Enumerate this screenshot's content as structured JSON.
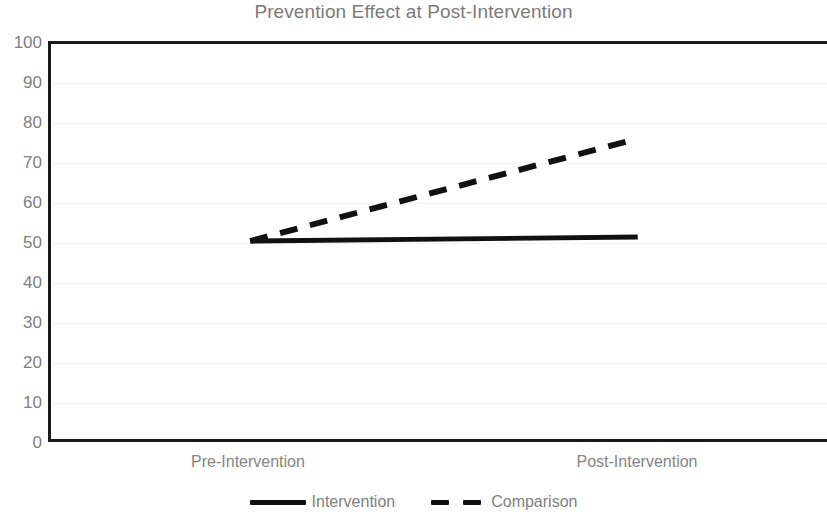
{
  "chart_data": {
    "type": "line",
    "title": "Prevention Effect at Post-Intervention",
    "xlabel": "",
    "ylabel": "",
    "categories": [
      "Pre-Intervention",
      "Post-Intervention"
    ],
    "ylim": [
      0,
      100
    ],
    "y_ticks": [
      100,
      90,
      80,
      70,
      60,
      50,
      40,
      30,
      20,
      10,
      0
    ],
    "grid": true,
    "legend_position": "bottom",
    "series": [
      {
        "name": "Intervention",
        "values": [
          50,
          51
        ],
        "style": "solid",
        "color": "#111111"
      },
      {
        "name": "Comparison",
        "values": [
          50,
          76
        ],
        "style": "dashed",
        "color": "#111111"
      }
    ]
  },
  "axis": {
    "y_tick_labels": [
      "100",
      "90",
      "80",
      "70",
      "60",
      "50",
      "40",
      "30",
      "20",
      "10",
      "0"
    ],
    "x_tick_labels": [
      "Pre-Intervention",
      "Post-Intervention"
    ]
  },
  "legend": {
    "items": [
      {
        "label": "Intervention",
        "style": "solid"
      },
      {
        "label": "Comparison",
        "style": "dashed"
      }
    ]
  },
  "colors": {
    "title": "#7b7b7b",
    "tick_text": "#808080",
    "axis_line": "#1a1a1a",
    "gridline": "#f4f4f4",
    "series_line": "#111111",
    "background": "#ffffff"
  }
}
